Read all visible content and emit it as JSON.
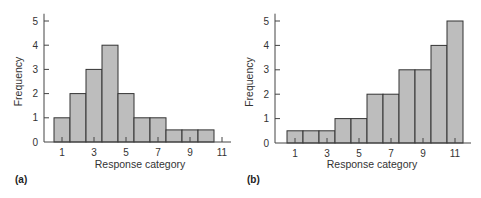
{
  "chart_data": [
    {
      "type": "bar",
      "panel": "(a)",
      "title": "",
      "xlabel": "Response category",
      "ylabel": "Frequency",
      "categories": [
        1,
        2,
        3,
        4,
        5,
        6,
        7,
        8,
        9,
        10,
        11
      ],
      "values": [
        1,
        2,
        3,
        4,
        2,
        1,
        1,
        0.5,
        0.5,
        0.5,
        0
      ],
      "x_tick_labels": [
        "1",
        "3",
        "5",
        "7",
        "9",
        "11"
      ],
      "y_tick_labels": [
        "0",
        "1",
        "2",
        "3",
        "4",
        "5"
      ],
      "ylim": [
        0,
        5
      ],
      "grid": false,
      "bar_color": "#bdbdbd"
    },
    {
      "type": "bar",
      "panel": "(b)",
      "title": "",
      "xlabel": "Response category",
      "ylabel": "Frequency",
      "categories": [
        1,
        2,
        3,
        4,
        5,
        6,
        7,
        8,
        9,
        10,
        11
      ],
      "values": [
        0.5,
        0.5,
        0.5,
        1,
        1,
        2,
        2,
        3,
        3,
        4,
        5
      ],
      "x_tick_labels": [
        "1",
        "3",
        "5",
        "7",
        "9",
        "11"
      ],
      "y_tick_labels": [
        "0",
        "1",
        "2",
        "3",
        "4",
        "5"
      ],
      "ylim": [
        0,
        5
      ],
      "grid": false,
      "bar_color": "#bdbdbd"
    }
  ]
}
